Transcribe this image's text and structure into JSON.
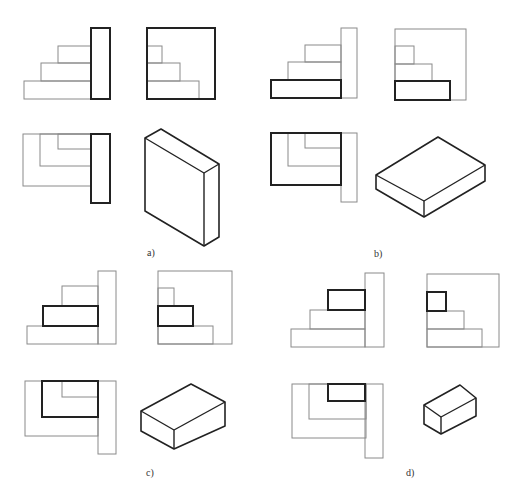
{
  "figure": {
    "colors": {
      "thin_line": "#8a8a8a",
      "bold_line": "#222222",
      "background": "#ffffff"
    },
    "panels": [
      {
        "id": "a",
        "label": "a)",
        "label_pos": [
          147,
          256
        ],
        "front_view": {
          "rects": [
            {
              "x": 24,
              "y": 81,
              "w": 67,
              "h": 18,
              "style": "thin"
            },
            {
              "x": 41,
              "y": 63,
              "w": 50,
              "h": 18,
              "style": "thin"
            },
            {
              "x": 58,
              "y": 46,
              "w": 33,
              "h": 17,
              "style": "thin"
            },
            {
              "x": 91,
              "y": 28,
              "w": 19,
              "h": 71,
              "style": "bold"
            }
          ]
        },
        "side_view": {
          "rects": [
            {
              "x": 147,
              "y": 81,
              "w": 52,
              "h": 18,
              "style": "thin"
            },
            {
              "x": 147,
              "y": 63,
              "w": 33,
              "h": 18,
              "style": "thin"
            },
            {
              "x": 147,
              "y": 46,
              "w": 15,
              "h": 17,
              "style": "thin"
            },
            {
              "x": 147,
              "y": 28,
              "w": 68,
              "h": 71,
              "style": "bold"
            }
          ]
        },
        "top_view": {
          "rects": [
            {
              "x": 23,
              "y": 134,
              "w": 68,
              "h": 52,
              "style": "thin"
            },
            {
              "x": 40,
              "y": 134,
              "w": 51,
              "h": 32,
              "style": "thin"
            },
            {
              "x": 58,
              "y": 134,
              "w": 33,
              "h": 15,
              "style": "thin"
            },
            {
              "x": 91,
              "y": 134,
              "w": 19,
              "h": 69,
              "style": "bold"
            }
          ]
        },
        "isometric": {
          "outline": [
            [
              145,
              138
            ],
            [
              161,
              129
            ],
            [
              219,
              164
            ],
            [
              219,
              237
            ],
            [
              204,
              246
            ],
            [
              145,
              211
            ]
          ],
          "edges": [
            [
              [
                145,
                138
              ],
              [
                204,
                173
              ]
            ],
            [
              [
                204,
                173
              ],
              [
                219,
                164
              ]
            ],
            [
              [
                204,
                173
              ],
              [
                204,
                246
              ]
            ]
          ]
        }
      },
      {
        "id": "b",
        "label": "b)",
        "label_pos": [
          374,
          257
        ],
        "front_view": {
          "rects": [
            {
              "x": 288,
              "y": 62,
              "w": 53,
              "h": 18,
              "style": "thin"
            },
            {
              "x": 305,
              "y": 45,
              "w": 36,
              "h": 17,
              "style": "thin"
            },
            {
              "x": 341,
              "y": 28,
              "w": 16,
              "h": 70,
              "style": "thin"
            },
            {
              "x": 271,
              "y": 80,
              "w": 70,
              "h": 18,
              "style": "bold"
            }
          ]
        },
        "side_view": {
          "rects": [
            {
              "x": 395,
              "y": 29,
              "w": 71,
              "h": 71,
              "style": "thin"
            },
            {
              "x": 395,
              "y": 64,
              "w": 37,
              "h": 17,
              "style": "thin"
            },
            {
              "x": 395,
              "y": 46,
              "w": 19,
              "h": 18,
              "style": "thin"
            },
            {
              "x": 395,
              "y": 81,
              "w": 55,
              "h": 19,
              "style": "bold"
            }
          ]
        },
        "top_view": {
          "rects": [
            {
              "x": 288,
              "y": 133,
              "w": 53,
              "h": 33,
              "style": "thin"
            },
            {
              "x": 305,
              "y": 133,
              "w": 36,
              "h": 15,
              "style": "thin"
            },
            {
              "x": 341,
              "y": 133,
              "w": 16,
              "h": 69,
              "style": "thin"
            },
            {
              "x": 271,
              "y": 133,
              "w": 70,
              "h": 52,
              "style": "bold"
            }
          ]
        },
        "isometric": {
          "outline": [
            [
              376,
              175
            ],
            [
              438,
              137
            ],
            [
              485,
              165
            ],
            [
              485,
              181
            ],
            [
              424,
              217
            ],
            [
              376,
              189
            ]
          ],
          "edges": [
            [
              [
                376,
                175
              ],
              [
                424,
                201
              ]
            ],
            [
              [
                424,
                201
              ],
              [
                485,
                165
              ]
            ],
            [
              [
                424,
                201
              ],
              [
                424,
                217
              ]
            ]
          ]
        }
      },
      {
        "id": "c",
        "label": "c)",
        "label_pos": [
          146,
          476
        ],
        "front_view": {
          "rects": [
            {
              "x": 27,
              "y": 326,
              "w": 71,
              "h": 18,
              "style": "thin"
            },
            {
              "x": 62,
              "y": 286,
              "w": 36,
              "h": 20,
              "style": "thin"
            },
            {
              "x": 98,
              "y": 271,
              "w": 18,
              "h": 73,
              "style": "thin"
            },
            {
              "x": 43,
              "y": 306,
              "w": 55,
              "h": 20,
              "style": "bold"
            }
          ]
        },
        "side_view": {
          "rects": [
            {
              "x": 158,
              "y": 271,
              "w": 74,
              "h": 73,
              "style": "thin"
            },
            {
              "x": 158,
              "y": 326,
              "w": 55,
              "h": 18,
              "style": "thin"
            },
            {
              "x": 158,
              "y": 288,
              "w": 16,
              "h": 18,
              "style": "thin"
            },
            {
              "x": 158,
              "y": 306,
              "w": 35,
              "h": 20,
              "style": "bold"
            }
          ]
        },
        "top_view": {
          "rects": [
            {
              "x": 25,
              "y": 381,
              "w": 73,
              "h": 55,
              "style": "thin"
            },
            {
              "x": 62,
              "y": 381,
              "w": 36,
              "h": 16,
              "style": "thin"
            },
            {
              "x": 98,
              "y": 381,
              "w": 18,
              "h": 73,
              "style": "thin"
            },
            {
              "x": 42,
              "y": 381,
              "w": 56,
              "h": 36,
              "style": "bold"
            }
          ]
        },
        "isometric": {
          "outline": [
            [
              141,
              411
            ],
            [
              191,
              384
            ],
            [
              225,
              402
            ],
            [
              225,
              426
            ],
            [
              174,
              449
            ],
            [
              141,
              431
            ]
          ],
          "edges": [
            [
              [
                141,
                411
              ],
              [
                174,
                430
              ]
            ],
            [
              [
                174,
                430
              ],
              [
                225,
                402
              ]
            ],
            [
              [
                174,
                430
              ],
              [
                174,
                449
              ]
            ]
          ]
        }
      },
      {
        "id": "d",
        "label": "d)",
        "label_pos": [
          406,
          476
        ],
        "front_view": {
          "rects": [
            {
              "x": 291,
              "y": 329,
              "w": 74,
              "h": 18,
              "style": "thin"
            },
            {
              "x": 310,
              "y": 310,
              "w": 55,
              "h": 19,
              "style": "thin"
            },
            {
              "x": 365,
              "y": 273,
              "w": 19,
              "h": 74,
              "style": "thin"
            },
            {
              "x": 328,
              "y": 290,
              "w": 37,
              "h": 20,
              "style": "bold"
            }
          ]
        },
        "side_view": {
          "rects": [
            {
              "x": 427,
              "y": 274,
              "w": 72,
              "h": 73,
              "style": "thin"
            },
            {
              "x": 427,
              "y": 329,
              "w": 55,
              "h": 18,
              "style": "thin"
            },
            {
              "x": 427,
              "y": 311,
              "w": 37,
              "h": 18,
              "style": "thin"
            },
            {
              "x": 427,
              "y": 292,
              "w": 19,
              "h": 19,
              "style": "bold"
            }
          ]
        },
        "top_view": {
          "rects": [
            {
              "x": 292,
              "y": 384,
              "w": 74,
              "h": 54,
              "style": "thin"
            },
            {
              "x": 309,
              "y": 384,
              "w": 57,
              "h": 35,
              "style": "thin"
            },
            {
              "x": 365,
              "y": 384,
              "w": 18,
              "h": 74,
              "style": "thin"
            },
            {
              "x": 328,
              "y": 384,
              "w": 37,
              "h": 17,
              "style": "bold"
            }
          ]
        },
        "isometric": {
          "outline": [
            [
              424,
              405
            ],
            [
              460,
              385
            ],
            [
              476,
              398
            ],
            [
              476,
              416
            ],
            [
              441,
              434
            ],
            [
              424,
              424
            ]
          ],
          "edges": [
            [
              [
                424,
                405
              ],
              [
                441,
                417
              ]
            ],
            [
              [
                441,
                417
              ],
              [
                476,
                398
              ]
            ],
            [
              [
                441,
                417
              ],
              [
                441,
                434
              ]
            ]
          ]
        }
      }
    ]
  }
}
